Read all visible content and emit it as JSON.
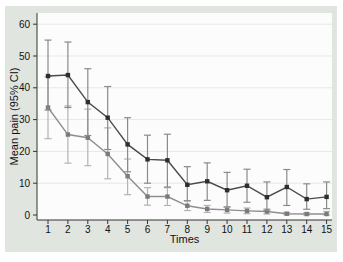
{
  "figure": {
    "background": "#e1e5e0",
    "plot_background": "#fcfcfc",
    "grid_color": "#e7e7e7",
    "axis_color": "#333333",
    "text_color": "#111111"
  },
  "chart_data": {
    "type": "line",
    "xlabel": "Times",
    "ylabel": "Mean pain (95% CI)",
    "x": [
      1,
      2,
      3,
      4,
      5,
      6,
      7,
      8,
      9,
      10,
      11,
      12,
      13,
      14,
      15
    ],
    "yticks": [
      0,
      10,
      20,
      30,
      40,
      50,
      60
    ],
    "ylim": [
      -1.6,
      63.5
    ],
    "xlim": [
      0.45,
      15.3
    ],
    "grid": true,
    "legend": "none",
    "error_bars": "95% CI",
    "marker": "square",
    "series": [
      {
        "name": "series-1-dark",
        "line_color": "#4a4a4a",
        "marker_color": "#2e2e2e",
        "errorbar_color": "#8a8a8a",
        "values": [
          43.7,
          44,
          35.5,
          30.6,
          22.2,
          17.5,
          17.2,
          9.5,
          10.6,
          7.8,
          9.2,
          5.6,
          8.8,
          5,
          5.7
        ],
        "ci_low": [
          33,
          33.8,
          25,
          20.6,
          13.6,
          10,
          8.8,
          4.5,
          4.6,
          2.5,
          4,
          1.5,
          3,
          1.8,
          2
        ],
        "ci_high": [
          55,
          54.4,
          46,
          40.4,
          30.6,
          25.1,
          25.4,
          15.2,
          16.4,
          13.4,
          14.4,
          10.4,
          14.3,
          9.8,
          10.4
        ]
      },
      {
        "name": "series-2-gray",
        "line_color": "#8e8e8e",
        "marker_color": "#7a7a7a",
        "errorbar_color": "#b3b3b3",
        "values": [
          33.8,
          25.3,
          24.3,
          19.2,
          12.2,
          5.8,
          5.8,
          2.9,
          1.9,
          1.6,
          1.3,
          1.1,
          0.4,
          0.3,
          0.3
        ],
        "ci_low": [
          24,
          16.3,
          15.5,
          11.4,
          6.4,
          3.1,
          3,
          1.4,
          0.8,
          0.6,
          0.4,
          0.3,
          0.1,
          0,
          0
        ],
        "ci_high": [
          43.5,
          34.3,
          33.3,
          27.4,
          17.6,
          8.6,
          8.6,
          4.4,
          3,
          2.6,
          2.2,
          1.9,
          0.8,
          0.7,
          1.1
        ]
      }
    ]
  }
}
